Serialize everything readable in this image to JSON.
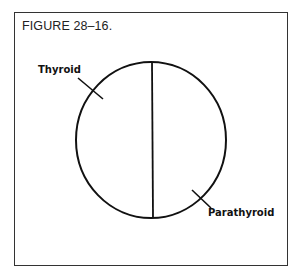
{
  "figure": {
    "title": "FIGURE 28–16.",
    "labels": {
      "left": "Thyroid",
      "right": "Parathyroid"
    },
    "shape": "circle divided by a vertical line into two halves",
    "colors": {
      "line": "#111111",
      "frame": "#333333",
      "background": "#ffffff"
    }
  }
}
